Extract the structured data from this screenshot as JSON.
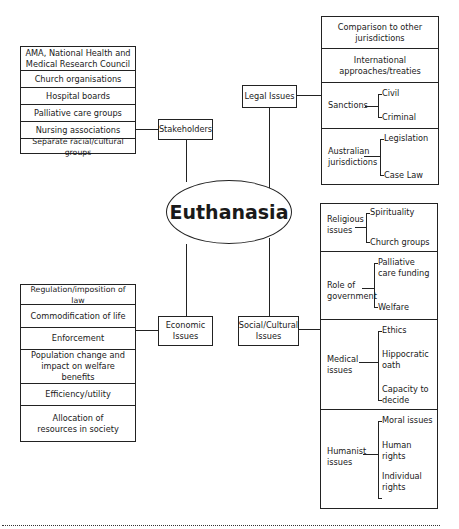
{
  "center": {
    "label": "Euthanasia"
  },
  "stakeholders": {
    "label": "Stakeholders",
    "items": [
      "AMA, National Health and Medical Research Council",
      "Church organisations",
      "Hospital boards",
      "Palliative care groups",
      "Nursing associations",
      "Separate racial/cultural groups"
    ]
  },
  "legal": {
    "label": "Legal Issues",
    "items": [
      {
        "label": "Comparison to other jurisdictions"
      },
      {
        "label": "International approaches/treaties"
      },
      {
        "label": "Sanctions",
        "children": [
          "Civil",
          "Criminal"
        ]
      },
      {
        "label": "Australian jurisdictions",
        "children": [
          "Legislation",
          "Case Law"
        ]
      }
    ]
  },
  "economic": {
    "label": "Economic Issues",
    "items": [
      "Regulation/imposition of law",
      "Commodification of life",
      "Enforcement",
      "Population change and impact on welfare benefits",
      "Efficiency/utility",
      "Allocation of resources in society"
    ]
  },
  "social": {
    "label": "Social/Cultural Issues",
    "items": [
      {
        "label": "Religious issues",
        "children": [
          "Spirituality",
          "Church groups"
        ]
      },
      {
        "label": "Role of government",
        "children": [
          "Palliative care funding",
          "Welfare"
        ]
      },
      {
        "label": "Medical issues",
        "children": [
          "Ethics",
          "Hippocratic oath",
          "Capacity to decide"
        ]
      },
      {
        "label": "Humanist issues",
        "children": [
          "Moral issues",
          "Human rights",
          "Individual rights"
        ]
      }
    ]
  }
}
